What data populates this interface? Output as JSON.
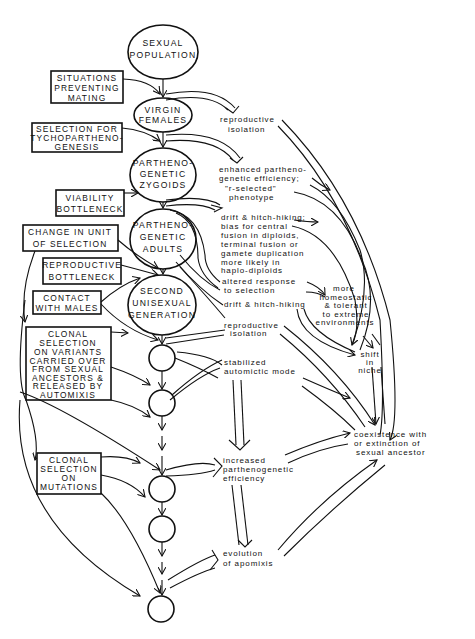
{
  "diagram": {
    "nodes": {
      "sexual_population": [
        "SEXUAL",
        "POPULATION"
      ],
      "virgin_females": [
        "VIRGIN",
        "FEMALES"
      ],
      "zygoids": [
        "PARTHENO-",
        "GENETIC",
        "ZYGOIDS"
      ],
      "adults": [
        "PARTHENO-",
        "GENETIC",
        "ADULTS"
      ],
      "second_generation": [
        "SECOND",
        "UNISEXUAL",
        "GENERATION"
      ]
    },
    "factors": {
      "situations": [
        "SITUATIONS",
        "PREVENTING",
        "MATING"
      ],
      "tycho": [
        "SELECTION FOR",
        "TYCHOPARTHENO-",
        "GENESIS"
      ],
      "viability": [
        "VIABILITY",
        "BOTTLENECK"
      ],
      "change_unit": [
        "CHANGE IN UNIT",
        "OF SELECTION"
      ],
      "reproductive": [
        "REPRODUCTIVE",
        "BOTTLENECK"
      ],
      "contact": [
        "CONTACT",
        "WITH MALES"
      ],
      "clonal_variants": [
        "CLONAL",
        "SELECTION",
        "ON VARIANTS",
        "CARRIED OVER",
        "FROM SEXUAL",
        "ANCESTORS &",
        "RELEASED BY",
        "AUTOMIXIS"
      ],
      "clonal_mutations": [
        "CLONAL",
        "SELECTION",
        "ON",
        "MUTATIONS"
      ]
    },
    "outcomes": {
      "repro_isolation_1": [
        "reproductive",
        "isolation"
      ],
      "enhanced": [
        "enhanced partheno-",
        "genetic efficiency;",
        "\"r-selected\"",
        "phenotype"
      ],
      "drift_bias": [
        "drift & hitch-hiking;",
        "bias for central",
        "fusion in diploids,",
        "terminal fusion or",
        "gamete duplication",
        "more likely in",
        "haplo-diploids"
      ],
      "altered": [
        "altered response",
        "to selection"
      ],
      "homeostatic": [
        "more",
        "homeostatic",
        "& tolerant",
        "to extreme",
        "environments"
      ],
      "drift_2": [
        "drift & hitch-hiking"
      ],
      "repro_isolation_2": [
        "reproductive",
        "isolation"
      ],
      "shift": [
        "shift",
        "in",
        "niche"
      ],
      "stabilized": [
        "stabilized",
        "automictic mode"
      ],
      "increased": [
        "increased",
        "parthenogenetic",
        "efficiency"
      ],
      "coexistence": [
        "coexistence with",
        "or extinction of",
        "sexual ancestor"
      ],
      "apomixis": [
        "evolution",
        "of apomixis"
      ]
    },
    "colors": {
      "ink": "#111111",
      "paper": "#ffffff"
    }
  }
}
